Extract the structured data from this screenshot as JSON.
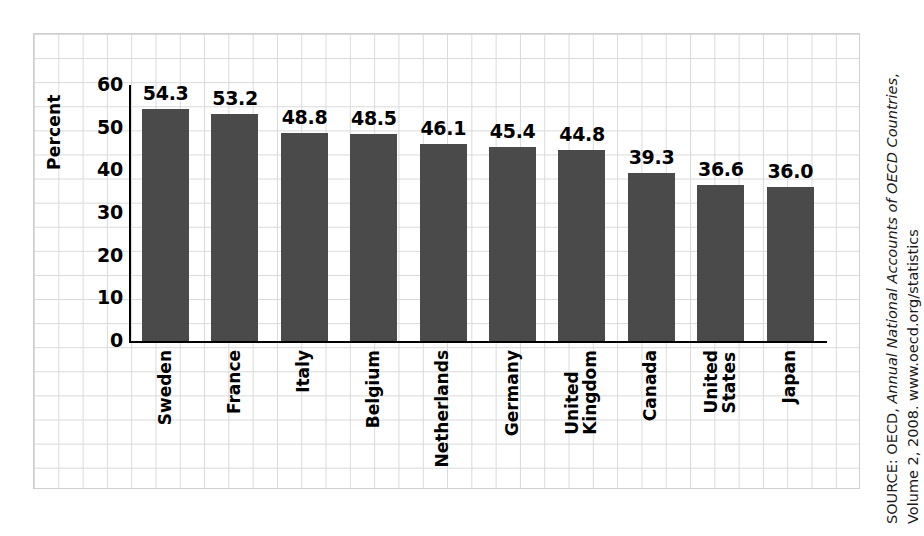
{
  "chart_data": {
    "type": "bar",
    "title": "",
    "xlabel": "",
    "ylabel": "Percent",
    "ylim": [
      0,
      60
    ],
    "yticks": [
      "0",
      "10",
      "20",
      "30",
      "40",
      "50",
      "60"
    ],
    "grid": true,
    "legend": "none",
    "bar_color": "#4a4a4a",
    "categories": [
      "Sweden",
      "France",
      "Italy",
      "Belgium",
      "Netherlands",
      "Germany",
      "United Kingdom",
      "Canada",
      "United States",
      "Japan"
    ],
    "category_lines": [
      [
        "Sweden"
      ],
      [
        "France"
      ],
      [
        "Italy"
      ],
      [
        "Belgium"
      ],
      [
        "Netherlands"
      ],
      [
        "Germany"
      ],
      [
        "United",
        "Kingdom"
      ],
      [
        "Canada"
      ],
      [
        "United",
        "States"
      ],
      [
        "Japan"
      ]
    ],
    "values": [
      54.3,
      53.2,
      48.8,
      48.5,
      46.1,
      45.4,
      44.8,
      39.3,
      36.6,
      36.0
    ],
    "value_labels": [
      "54.3",
      "53.2",
      "48.8",
      "48.5",
      "46.1",
      "45.4",
      "44.8",
      "39.3",
      "36.6",
      "36.0"
    ]
  },
  "axis": {
    "y_label": "Percent",
    "y_ticks": [
      "60",
      "50",
      "40",
      "30",
      "20",
      "10",
      "0"
    ]
  },
  "source": {
    "prefix": "SOURCE: OECD, ",
    "italic": "Annual National Accounts of OECD Countries",
    "suffix": ",",
    "line2": "Volume 2, 2008. www.oecd.org/statistics",
    "full": "SOURCE: OECD, Annual National Accounts of OECD Countries, Volume 2, 2008. www.oecd.org/statistics"
  }
}
